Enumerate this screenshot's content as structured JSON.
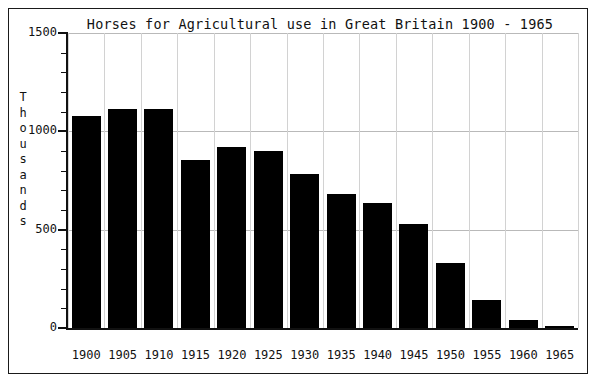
{
  "figure": {
    "title": "Horses for Agricultural use in Great Britain 1900 - 1965",
    "y_axis_title": "Thousands",
    "colors": {
      "bar": "#000000",
      "frame": "#1a1a1a",
      "grid": "#c6c6c6",
      "text": "#111111",
      "background": "#ffffff"
    }
  },
  "chart_data": {
    "type": "bar",
    "title": "Horses for Agricultural use in Great Britain 1900 - 1965",
    "xlabel": "",
    "ylabel": "Thousands",
    "categories": [
      "1900",
      "1905",
      "1910",
      "1915",
      "1920",
      "1925",
      "1930",
      "1935",
      "1940",
      "1945",
      "1950",
      "1955",
      "1960",
      "1965"
    ],
    "values": [
      1078,
      1113,
      1113,
      854,
      920,
      900,
      783,
      681,
      636,
      529,
      330,
      142,
      40,
      10
    ],
    "ylim": [
      0,
      1500
    ],
    "ytick_major": [
      0,
      500,
      1000,
      1500
    ],
    "ytick_major_labels": [
      "0",
      "500",
      "1000",
      "1500"
    ],
    "ytick_minor_step": 100,
    "grid": true,
    "legend": null
  }
}
